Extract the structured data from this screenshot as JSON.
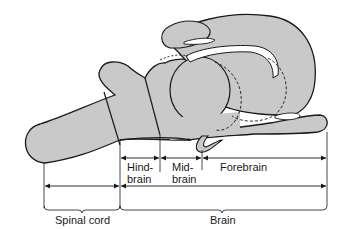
{
  "diagram": {
    "colors": {
      "fill": "#c9c9c9",
      "stroke": "#1a1a1a",
      "cavity": "#ffffff",
      "background": "#ffffff"
    },
    "region_labels": {
      "hindbrain_line1": "Hind-",
      "hindbrain_line2": "brain",
      "midbrain_line1": "Mid-",
      "midbrain_line2": "brain",
      "forebrain": "Forebrain"
    },
    "bracket_labels": {
      "spinal_cord": "Spinal cord",
      "brain": "Brain"
    }
  }
}
